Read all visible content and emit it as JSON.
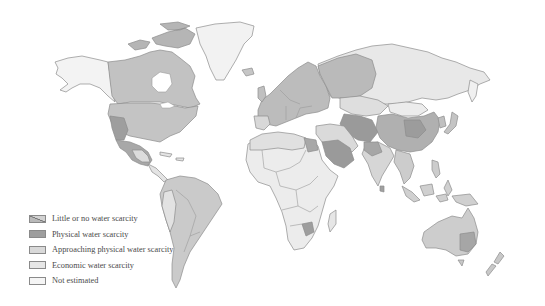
{
  "map": {
    "title": "World water scarcity map",
    "colors": {
      "little": "#b9b9b9",
      "physical": "#9e9e9e",
      "approaching": "#d6d6d6",
      "economic": "#e4e4e4",
      "not_estimated": "#f4f4f4",
      "outline": "#8c8c8c",
      "background": "#ffffff"
    }
  },
  "legend": {
    "items": [
      {
        "key": "little",
        "label": "Little or no water scarcity",
        "color": "#b9b9b9",
        "pattern": "diagonal"
      },
      {
        "key": "physical",
        "label": "Physical water scarcity",
        "color": "#9e9e9e"
      },
      {
        "key": "approaching",
        "label": "Approaching physical water scarcity",
        "color": "#d9d9d9"
      },
      {
        "key": "economic",
        "label": "Economic water scarcity",
        "color": "#e6e6e6"
      },
      {
        "key": "not_estimated",
        "label": "Not estimated",
        "color": "#f5f5f5"
      }
    ]
  }
}
